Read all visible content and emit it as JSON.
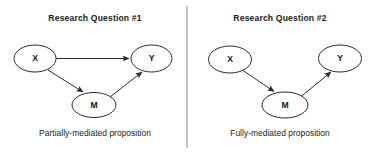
{
  "figure": {
    "width": 372,
    "height": 154,
    "background_color": "#ffffff",
    "stroke_color": "#2b2b2b",
    "text_color": "#1a1a1a",
    "divider_color": "#8d8d8d"
  },
  "divider": {
    "label": "panel-divider",
    "x": 187,
    "y1": 6,
    "y2": 148
  },
  "panels": [
    {
      "id": "research-question-1",
      "title": "Research Question #1",
      "title_x": 95,
      "title_y": 21,
      "caption": "Partially-mediated proposition",
      "caption_x": 95,
      "caption_y": 136,
      "nodes": [
        {
          "id": "x",
          "label": "X",
          "cx": 35,
          "cy": 58.5,
          "rx": 21,
          "ry": 13.5
        },
        {
          "id": "y",
          "label": "Y",
          "cx": 151.5,
          "cy": 58.5,
          "rx": 20.5,
          "ry": 13.5
        },
        {
          "id": "m",
          "label": "M",
          "cx": 94,
          "cy": 105,
          "rx": 22,
          "ry": 12.5
        }
      ],
      "edges": [
        {
          "id": "x-to-y",
          "from": "X",
          "to": "Y",
          "x1": 56,
          "y1": 58.5,
          "x2": 129,
          "y2": 58.5
        },
        {
          "id": "x-to-m",
          "from": "X",
          "to": "M",
          "x1": 48,
          "y1": 70,
          "x2": 83,
          "y2": 92
        },
        {
          "id": "m-to-y",
          "from": "M",
          "to": "Y",
          "x1": 110,
          "y1": 97,
          "x2": 142,
          "y2": 72
        }
      ]
    },
    {
      "id": "research-question-2",
      "title": "Research Question #2",
      "title_x": 280,
      "title_y": 21,
      "caption": "Fully-mediated proposition",
      "caption_x": 280,
      "caption_y": 136,
      "nodes": [
        {
          "id": "x",
          "label": "X",
          "cx": 230,
          "cy": 59.5,
          "rx": 21.5,
          "ry": 13.5
        },
        {
          "id": "y",
          "label": "Y",
          "cx": 340,
          "cy": 58.5,
          "rx": 21.5,
          "ry": 13.5
        },
        {
          "id": "m",
          "label": "M",
          "cx": 285,
          "cy": 105,
          "rx": 23,
          "ry": 13
        }
      ],
      "edges": [
        {
          "id": "x-to-m",
          "from": "X",
          "to": "M",
          "x1": 243,
          "y1": 70.5,
          "x2": 274,
          "y2": 91.5
        },
        {
          "id": "m-to-y",
          "from": "M",
          "to": "Y",
          "x1": 301,
          "y1": 96.5,
          "x2": 331,
          "y2": 72
        }
      ]
    }
  ]
}
